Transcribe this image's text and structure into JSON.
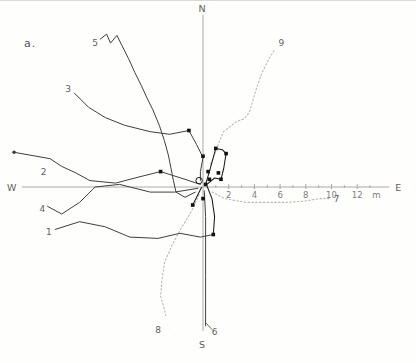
{
  "panel_label": "a.",
  "chart_data": {
    "type": "line",
    "axes": {
      "horizontal": {
        "west_label": "W",
        "east_label": "E",
        "unit_label": "m",
        "major_ticks": [
          2,
          4,
          6,
          8,
          10,
          12
        ],
        "minor_ticks": [
          1,
          3,
          5,
          7,
          9,
          11,
          13
        ],
        "west_extent_m": -14.1,
        "east_extent_m": 14.5,
        "unit_pos_m": 13.5
      },
      "vertical": {
        "north_label": "N",
        "south_label": "S",
        "north_extent_m": 13.4,
        "south_extent_m": -11.2
      }
    },
    "tracks": [
      {
        "id": 1,
        "label": "1",
        "style": "solid",
        "label_pos_m": [
          -12.0,
          -3.5
        ],
        "points_m": [
          [
            -11.5,
            -3.3
          ],
          [
            -9.6,
            -2.7
          ],
          [
            -7.6,
            -3.1
          ],
          [
            -5.7,
            -3.9
          ],
          [
            -3.5,
            -4.0
          ],
          [
            -1.8,
            -3.6
          ],
          [
            -0.2,
            -3.9
          ],
          [
            0.8,
            -3.7
          ]
        ]
      },
      {
        "id": 2,
        "label": "2",
        "style": "solid",
        "label_pos_m": [
          -12.4,
          1.2
        ],
        "end_dot_m": [
          -14.7,
          2.7
        ],
        "points_m": [
          [
            -14.7,
            2.7
          ],
          [
            -11.9,
            2.2
          ],
          [
            -11.0,
            1.6
          ],
          [
            -9.9,
            1.1
          ],
          [
            -8.8,
            0.5
          ],
          [
            -6.8,
            0.3
          ],
          [
            -4.9,
            0.8
          ],
          [
            -3.3,
            1.2
          ],
          [
            -1.4,
            0.6
          ],
          [
            -0.2,
            0.2
          ]
        ]
      },
      {
        "id": 3,
        "label": "3",
        "style": "solid",
        "label_pos_m": [
          -10.5,
          7.6
        ],
        "points_m": [
          [
            -10.0,
            7.3
          ],
          [
            -8.9,
            6.2
          ],
          [
            -7.6,
            5.4
          ],
          [
            -6.1,
            4.8
          ],
          [
            -4.1,
            4.3
          ],
          [
            -2.6,
            4.1
          ],
          [
            -1.1,
            4.4
          ],
          [
            -0.5,
            3.3
          ],
          [
            0.0,
            2.3
          ],
          [
            -0.2,
            1.2
          ],
          [
            -0.2,
            0.5
          ]
        ]
      },
      {
        "id": 4,
        "label": "4",
        "style": "solid",
        "label_pos_m": [
          -12.5,
          -1.7
        ],
        "points_m": [
          [
            -12.1,
            -1.5
          ],
          [
            -11.0,
            -2.1
          ],
          [
            -9.6,
            -1.2
          ],
          [
            -8.4,
            0.0
          ],
          [
            -6.5,
            0.2
          ],
          [
            -4.1,
            -0.4
          ],
          [
            -2.2,
            -0.4
          ],
          [
            -0.4,
            -0.1
          ]
        ]
      },
      {
        "id": 5,
        "label": "5",
        "style": "solid",
        "label_pos_m": [
          -8.4,
          11.2
        ],
        "points_m": [
          [
            -8.0,
            11.5
          ],
          [
            -7.5,
            11.9
          ],
          [
            -7.2,
            11.2
          ],
          [
            -6.7,
            11.8
          ],
          [
            -6.3,
            11.0
          ],
          [
            -5.8,
            10.0
          ],
          [
            -5.3,
            8.9
          ],
          [
            -4.8,
            7.9
          ],
          [
            -4.4,
            7.0
          ],
          [
            -3.9,
            6.0
          ],
          [
            -3.4,
            4.8
          ],
          [
            -3.0,
            3.6
          ],
          [
            -2.7,
            2.5
          ],
          [
            -2.5,
            1.5
          ],
          [
            -2.3,
            0.5
          ],
          [
            -2.1,
            -0.4
          ],
          [
            -1.4,
            -0.8
          ],
          [
            -0.6,
            -0.4
          ]
        ]
      },
      {
        "id": 6,
        "label": "6",
        "style": "solid",
        "label_pos_m": [
          0.9,
          -11.3
        ],
        "leader_m": [
          [
            0.25,
            -10.6
          ],
          [
            0.7,
            -11.1
          ]
        ],
        "points_m": [
          [
            0.1,
            -0.3
          ],
          [
            0.2,
            -2.3
          ],
          [
            0.2,
            -4.6
          ],
          [
            0.2,
            -6.9
          ],
          [
            0.2,
            -9.1
          ],
          [
            0.2,
            -10.8
          ]
        ]
      },
      {
        "id": 7,
        "label": "7",
        "style": "dotted",
        "label_pos_m": [
          10.4,
          -0.9
        ],
        "points_m": [
          [
            0.7,
            -0.4
          ],
          [
            1.7,
            -0.9
          ],
          [
            3.3,
            -1.2
          ],
          [
            4.8,
            -1.2
          ],
          [
            6.4,
            -1.2
          ],
          [
            7.9,
            -1.1
          ],
          [
            9.1,
            -0.9
          ],
          [
            9.8,
            -0.9
          ]
        ]
      },
      {
        "id": 8,
        "label": "8",
        "style": "dotted",
        "label_pos_m": [
          -3.5,
          -11.1
        ],
        "points_m": [
          [
            -0.3,
            -0.6
          ],
          [
            -0.9,
            -1.9
          ],
          [
            -1.7,
            -3.2
          ],
          [
            -2.4,
            -4.5
          ],
          [
            -3.0,
            -5.9
          ],
          [
            -3.2,
            -7.3
          ],
          [
            -3.3,
            -8.5
          ],
          [
            -3.0,
            -9.5
          ],
          [
            -2.9,
            -10.0
          ]
        ]
      },
      {
        "id": 9,
        "label": "9",
        "style": "dotted",
        "label_pos_m": [
          6.1,
          11.2
        ],
        "points_m": [
          [
            0.6,
            1.8
          ],
          [
            1.0,
            2.8
          ],
          [
            1.3,
            3.6
          ],
          [
            1.6,
            4.3
          ],
          [
            2.1,
            4.7
          ],
          [
            2.6,
            5.1
          ],
          [
            3.2,
            5.3
          ],
          [
            3.6,
            5.8
          ],
          [
            3.9,
            6.8
          ],
          [
            4.2,
            7.8
          ],
          [
            4.6,
            8.9
          ],
          [
            5.1,
            9.9
          ],
          [
            5.5,
            10.6
          ]
        ]
      }
    ],
    "marked_route_segments_m": [
      [
        [
          0.2,
          0.2
        ],
        [
          0.5,
          1.2
        ],
        [
          1.0,
          3.0
        ],
        [
          1.5,
          2.9
        ],
        [
          1.8,
          2.6
        ],
        [
          1.6,
          1.4
        ],
        [
          1.4,
          0.6
        ],
        [
          0.9,
          0.7
        ],
        [
          0.3,
          0.2
        ]
      ],
      [
        [
          0.3,
          0.1
        ],
        [
          0.7,
          -0.9
        ],
        [
          0.9,
          -2.3
        ],
        [
          0.8,
          -3.7
        ]
      ],
      [
        [
          -0.1,
          0.0
        ],
        [
          -0.5,
          -0.8
        ],
        [
          -0.8,
          -1.4
        ]
      ]
    ],
    "markers_m": [
      [
        -1.1,
        4.4
      ],
      [
        0.0,
        2.4
      ],
      [
        -3.3,
        1.2
      ],
      [
        1.0,
        3.0
      ],
      [
        1.8,
        2.6
      ],
      [
        1.2,
        1.1
      ],
      [
        1.4,
        0.6
      ],
      [
        0.5,
        0.6
      ],
      [
        0.4,
        1.2
      ],
      [
        0.2,
        0.2
      ],
      [
        0.0,
        -0.9
      ],
      [
        -0.8,
        -1.4
      ],
      [
        0.8,
        -3.7
      ]
    ],
    "start_circle_m": [
      -0.3,
      0.5
    ],
    "colors": {
      "track_solid": "#3f3f3f",
      "track_dotted": "#b8b8b8",
      "marked_route": "#1a1a1a",
      "marker": "#111111",
      "axis": "#a0a0a0",
      "axis_text": "#7d7d7d",
      "label_text": "#606060"
    }
  }
}
